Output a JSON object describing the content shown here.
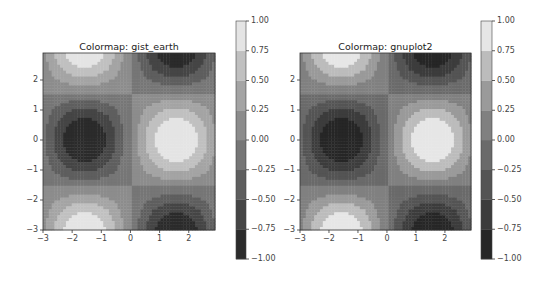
{
  "chart_data": [
    {
      "type": "heatmap",
      "subtype": "filled-contour",
      "title": "Colormap: gist_earth",
      "function": "z = sin(x) * cos(y)",
      "xlim": [
        -3,
        2.9
      ],
      "ylim": [
        -3,
        2.9
      ],
      "xticks": [
        "-3",
        "-2",
        "-1",
        "0",
        "1",
        "2"
      ],
      "yticks": [
        "-3",
        "-2",
        "-1",
        "0",
        "1",
        "2"
      ],
      "colorbar": {
        "ticks": [
          "-1.00",
          "-0.75",
          "-0.50",
          "-0.25",
          "0.00",
          "0.25",
          "0.50",
          "0.75",
          "1.00"
        ],
        "range": [
          -1,
          1
        ],
        "levels": 8
      },
      "grid": false
    },
    {
      "type": "heatmap",
      "subtype": "filled-contour",
      "title": "Colormap: gnuplot2",
      "function": "z = sin(x) * cos(y)",
      "xlim": [
        -3,
        2.9
      ],
      "ylim": [
        -3,
        2.9
      ],
      "xticks": [
        "-3",
        "-2",
        "-1",
        "0",
        "1",
        "2"
      ],
      "yticks": [
        "-3",
        "-2",
        "-1",
        "0",
        "1",
        "2"
      ],
      "colorbar": {
        "ticks": [
          "-1.00",
          "-0.75",
          "-0.50",
          "-0.25",
          "0.00",
          "0.25",
          "0.50",
          "0.75",
          "1.00"
        ],
        "range": [
          -1,
          1
        ],
        "levels": 8
      },
      "grid": false
    }
  ],
  "plots": [
    {
      "title": "Colormap: gist_earth",
      "colors": [
        "#2b2b2b",
        "#454545",
        "#5e5e5e",
        "#767676",
        "#8c8c8c",
        "#a4a4a4",
        "#c0c0c0",
        "#e4e4e4"
      ]
    },
    {
      "title": "Colormap: gnuplot2",
      "colors": [
        "#262626",
        "#3c3c3c",
        "#545454",
        "#6a6a6a",
        "#808080",
        "#9a9a9a",
        "#bcbcbc",
        "#e6e6e6"
      ]
    }
  ]
}
